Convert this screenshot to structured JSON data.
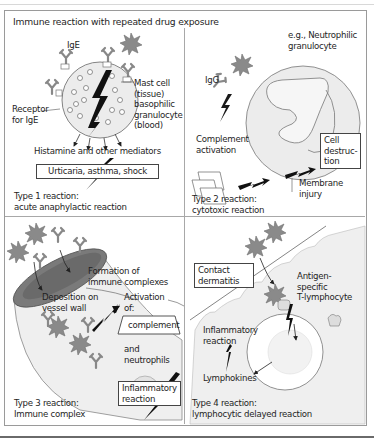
{
  "title": "Immune reaction with repeated drug exposure",
  "panels": {
    "type1": {
      "ige_label": "IgE",
      "mast_cell_label": [
        "Mast cell",
        "(tissue)",
        "basophilic",
        "granulocyte",
        "(blood)"
      ],
      "receptor_label": [
        "Receptor",
        "for IgE"
      ],
      "mediators": "Histamine and other mediators",
      "outcome_box": "Urticaria, asthma, shock",
      "caption": [
        "Type 1 reaction:",
        "acute anaphylactic reaction"
      ]
    },
    "type2": {
      "cell_label": [
        "e.g., Neutrophilic",
        "granulocyte"
      ],
      "igg_label": "IgG",
      "complement_label": [
        "Complement",
        "activation"
      ],
      "destruction_box": [
        "Cell",
        "destruc-",
        "tion"
      ],
      "membrane_label": [
        "Membrane",
        "injury"
      ],
      "caption": [
        "Type 2 reaction:",
        "cytotoxic reaction"
      ]
    },
    "type3": {
      "formation_label": [
        "Formation of",
        "immune complexes"
      ],
      "deposition_label": [
        "Deposition on",
        "vessel wall"
      ],
      "activation_label": [
        "Activation",
        "of:"
      ],
      "complement_box": "complement",
      "neutrophils_label": [
        "and",
        "neutrophils"
      ],
      "inflammatory_box": [
        "Inflammatory",
        "reaction"
      ],
      "caption": [
        "Type 3 reaction:",
        "Immune complex"
      ]
    },
    "type4": {
      "contact_box": [
        "Contact",
        "dermatitis"
      ],
      "tcell_label": [
        "Antigen-",
        "specific",
        "T-lymphocyte"
      ],
      "inflammatory_label": [
        "Inflammatory",
        "reaction"
      ],
      "lymphokines_label": "Lymphokines",
      "caption": [
        "Type 4 reaction:",
        "lymphocytic delayed reaction"
      ]
    }
  },
  "colors": {
    "antigen": "#8a8a8a",
    "cell_fill": "#ececec",
    "vessel_inner": "#7a7a7a",
    "frame": "#9a9a9a",
    "text": "#1e1e1e"
  }
}
